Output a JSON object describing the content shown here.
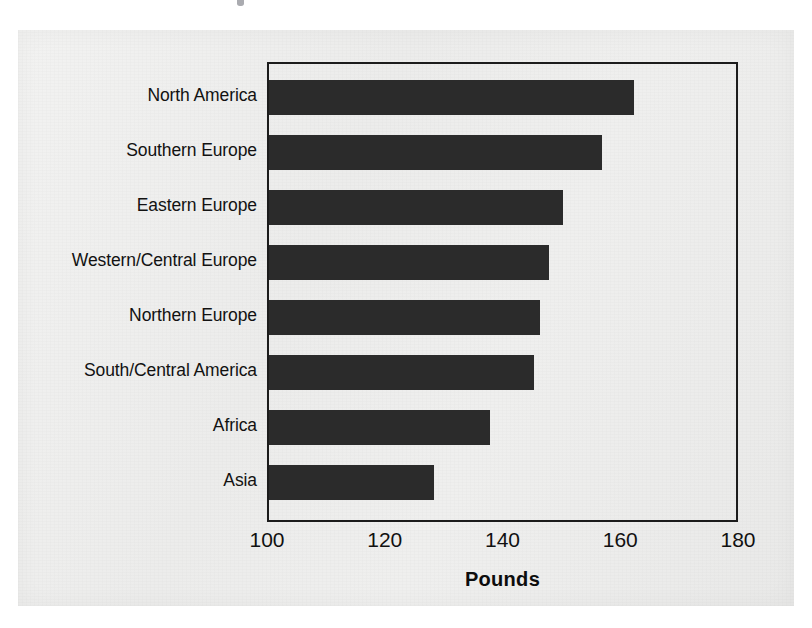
{
  "chart_data": {
    "type": "bar",
    "orientation": "horizontal",
    "title": "",
    "xlabel": "Pounds",
    "ylabel": "",
    "xlim": [
      100,
      180
    ],
    "xticks": [
      100,
      120,
      140,
      160,
      180
    ],
    "grid": false,
    "legend": null,
    "categories": [
      "North America",
      "Southern Europe",
      "Eastern Europe",
      "Western/Central Europe",
      "Northern Europe",
      "South/Central America",
      "Africa",
      "Asia"
    ],
    "values": [
      162,
      156.5,
      150,
      147.5,
      146,
      145,
      137.5,
      128
    ],
    "bar_color": "#2b2b2b",
    "axis_color": "#1c1c1c",
    "background_color": "#eeeeed"
  },
  "axis": {
    "title": "Pounds",
    "tick_labels": [
      "100",
      "120",
      "140",
      "160",
      "180"
    ]
  }
}
